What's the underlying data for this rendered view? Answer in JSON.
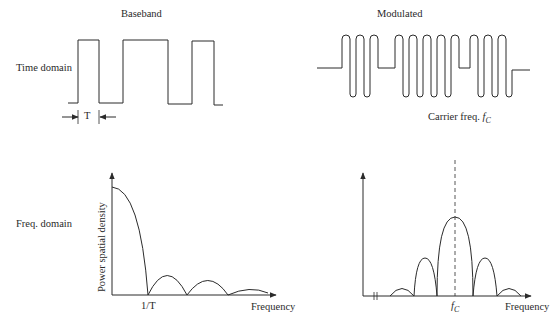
{
  "panels": {
    "baseband": {
      "title": "Baseband",
      "period_label": "T",
      "row_label": "Time domain"
    },
    "modulated": {
      "title": "Modulated",
      "carrier_label": "Carrier freq. ",
      "carrier_symbol": "f",
      "carrier_sub": "C"
    },
    "freq_baseband": {
      "row_label": "Freq. domain",
      "y_axis_label": "Power spatial density",
      "x_axis_label": "Frequency",
      "tick_label": "1/T"
    },
    "freq_modulated": {
      "x_axis_label": "Frequency",
      "tick_symbol": "f",
      "tick_sub": "C"
    }
  },
  "colors": {
    "line": "#2b2b2b",
    "background": "#ffffff"
  }
}
